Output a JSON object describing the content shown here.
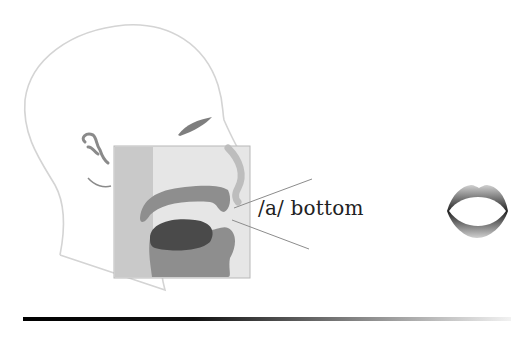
{
  "diagram": {
    "phoneme_label": "/a/ bottom",
    "elements": [
      "head-profile-outline",
      "ear",
      "eye",
      "vocal-tract-crosssection",
      "tongue",
      "lips-front-view",
      "pointer-lines"
    ],
    "colors": {
      "outline": "#d2d2d2",
      "box_fill": "#e4e4e4",
      "tract_gray": "#8e8e8e",
      "tongue_dark": "#4a4a4a",
      "text": "#222222"
    }
  }
}
